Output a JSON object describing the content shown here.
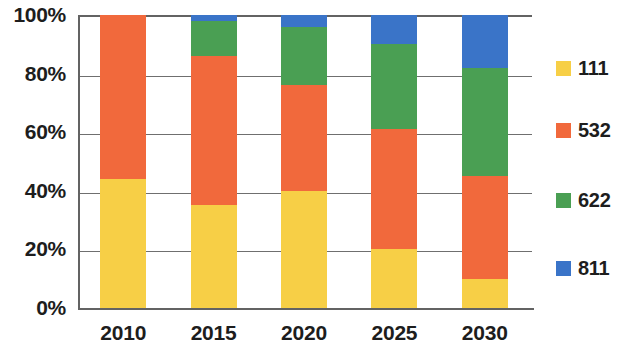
{
  "chart_data": {
    "type": "bar",
    "subtype": "stacked-100-percent",
    "title": "",
    "xlabel": "",
    "ylabel": "",
    "categories": [
      "2010",
      "2015",
      "2020",
      "2025",
      "2030"
    ],
    "series": [
      {
        "name": "111",
        "color": "#f7cf46",
        "values": [
          44,
          35,
          40,
          20,
          10
        ]
      },
      {
        "name": "532",
        "color": "#f1693c",
        "values": [
          56,
          51,
          36,
          41,
          35
        ]
      },
      {
        "name": "622",
        "color": "#4a9f53",
        "values": [
          0,
          12,
          20,
          29,
          37
        ]
      },
      {
        "name": "811",
        "color": "#3a74c8",
        "values": [
          0,
          2,
          4,
          10,
          18
        ]
      }
    ],
    "y_ticks": [
      "0%",
      "20%",
      "40%",
      "60%",
      "80%",
      "100%"
    ],
    "y_tick_values": [
      0,
      20,
      40,
      60,
      80,
      100
    ],
    "ylim": [
      0,
      100
    ],
    "grid": true,
    "legend_position": "right",
    "legend_entries": [
      "111",
      "532",
      "622",
      "811"
    ],
    "axis_color": "#636363",
    "grid_color": "#6f6f6f",
    "background_color": "#ffffff",
    "text_color": "#1d1d1d"
  }
}
